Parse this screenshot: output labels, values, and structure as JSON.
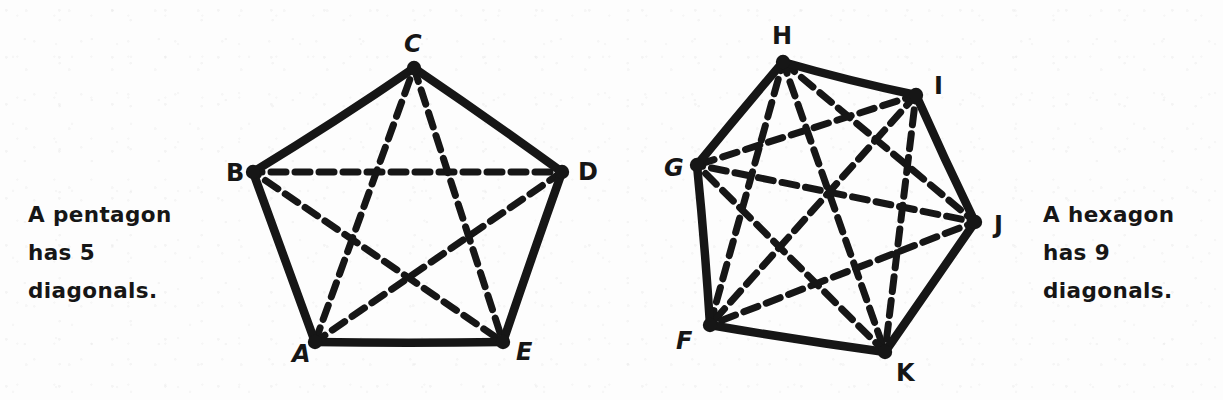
{
  "page": {
    "background_color": "#fdfdfd",
    "ink_color": "#161616",
    "width": 1223,
    "height": 400
  },
  "captions": {
    "left": {
      "lines": [
        "A pentagon",
        "has 5",
        "diagonals."
      ],
      "full_text": "A pentagon has 5 diagonals."
    },
    "right": {
      "lines": [
        "A hexagon",
        "has 9",
        "diagonals."
      ],
      "full_text": "A hexagon has 9 diagonals."
    }
  },
  "figures": [
    {
      "name": "pentagon",
      "shape": "pentagon",
      "sides": 5,
      "diagonal_count": 5,
      "vertices": [
        {
          "label": "C",
          "x": 414,
          "y": 68,
          "label_x": 404,
          "label_y": 52
        },
        {
          "label": "D",
          "x": 562,
          "y": 172,
          "label_x": 578,
          "label_y": 180
        },
        {
          "label": "E",
          "x": 503,
          "y": 342,
          "label_x": 516,
          "label_y": 360
        },
        {
          "label": "A",
          "x": 315,
          "y": 342,
          "label_x": 292,
          "label_y": 362
        },
        {
          "label": "B",
          "x": 253,
          "y": 172,
          "label_x": 226,
          "label_y": 181
        }
      ],
      "edges": [
        [
          "C",
          "D"
        ],
        [
          "D",
          "E"
        ],
        [
          "E",
          "A"
        ],
        [
          "A",
          "B"
        ],
        [
          "B",
          "C"
        ]
      ],
      "diagonals": [
        [
          "A",
          "C"
        ],
        [
          "A",
          "D"
        ],
        [
          "B",
          "D"
        ],
        [
          "B",
          "E"
        ],
        [
          "C",
          "E"
        ]
      ]
    },
    {
      "name": "hexagon",
      "shape": "hexagon",
      "sides": 6,
      "diagonal_count": 9,
      "vertices": [
        {
          "label": "H",
          "x": 783,
          "y": 62,
          "label_x": 772,
          "label_y": 44
        },
        {
          "label": "I",
          "x": 916,
          "y": 95,
          "label_x": 934,
          "label_y": 94
        },
        {
          "label": "J",
          "x": 975,
          "y": 222,
          "label_x": 994,
          "label_y": 233
        },
        {
          "label": "K",
          "x": 885,
          "y": 352,
          "label_x": 896,
          "label_y": 381
        },
        {
          "label": "F",
          "x": 710,
          "y": 325,
          "label_x": 676,
          "label_y": 349
        },
        {
          "label": "G",
          "x": 697,
          "y": 165,
          "label_x": 664,
          "label_y": 176
        }
      ],
      "edges": [
        [
          "H",
          "I"
        ],
        [
          "I",
          "J"
        ],
        [
          "J",
          "K"
        ],
        [
          "K",
          "F"
        ],
        [
          "F",
          "G"
        ],
        [
          "G",
          "H"
        ]
      ],
      "diagonals": [
        [
          "H",
          "J"
        ],
        [
          "H",
          "K"
        ],
        [
          "H",
          "F"
        ],
        [
          "I",
          "K"
        ],
        [
          "I",
          "F"
        ],
        [
          "I",
          "G"
        ],
        [
          "J",
          "F"
        ],
        [
          "J",
          "G"
        ],
        [
          "K",
          "G"
        ]
      ]
    }
  ]
}
